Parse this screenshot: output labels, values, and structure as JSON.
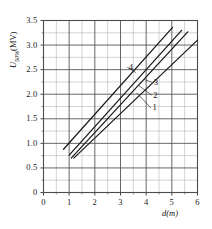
{
  "chart_data": {
    "type": "line",
    "title": "",
    "xlabel": "d(m)",
    "ylabel": "U50%(MV)",
    "ylabel_base": "U",
    "ylabel_sub": "50%",
    "ylabel_unit": "(MV)",
    "xlim": [
      0,
      6
    ],
    "ylim": [
      0,
      3.5
    ],
    "xticks": [
      "0",
      "1",
      "2",
      "3",
      "4",
      "5",
      "6"
    ],
    "xtick_values": [
      0,
      1,
      2,
      3,
      4,
      5,
      6
    ],
    "yticks": [
      "0",
      "0.5",
      "1.0",
      "1.5",
      "2.0",
      "2.5",
      "3.0",
      "3.5"
    ],
    "ytick_values": [
      0,
      0.5,
      1.0,
      1.5,
      2.0,
      2.5,
      3.0,
      3.5
    ],
    "grid": true,
    "grid_major_x_step": 1,
    "grid_minor_x_step": 0.5,
    "grid_major_y_step": 0.5,
    "grid_minor_y_step": 0.25,
    "legend": "inline-labels",
    "line_color": "#1a1a1a",
    "grid_color": "#4d4d4d",
    "grid_minor_color": "#b5b5b5",
    "series": [
      {
        "name": "1",
        "label": "1",
        "label_x": 4.25,
        "label_y": 1.72,
        "leader_to_x": 3.62,
        "leader_to_y": 2.03,
        "points": [
          [
            1.08,
            0.7
          ],
          [
            5.62,
            3.27
          ]
        ]
      },
      {
        "name": "2",
        "label": "2",
        "label_x": 4.28,
        "label_y": 1.98,
        "leader_to_x": 3.7,
        "leader_to_y": 2.18,
        "points": [
          [
            1.0,
            0.76
          ],
          [
            5.38,
            3.3
          ]
        ]
      },
      {
        "name": "3",
        "label": "3",
        "label_x": 4.3,
        "label_y": 2.24,
        "leader_to_x": 3.92,
        "leader_to_y": 2.3,
        "points": [
          [
            1.18,
            0.7
          ],
          [
            6.0,
            3.1
          ]
        ]
      },
      {
        "name": "4",
        "label": "4",
        "label_x": 3.32,
        "label_y": 2.55,
        "leader_to_x": 3.6,
        "leader_to_y": 2.44,
        "points": [
          [
            0.78,
            0.88
          ],
          [
            5.03,
            3.36
          ]
        ]
      }
    ]
  }
}
